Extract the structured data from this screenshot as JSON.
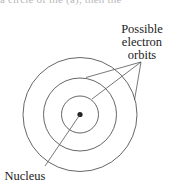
{
  "clipped_caption": "a circle of the (a), then the",
  "diagram": {
    "type": "bohr-atom-orbits",
    "labels": {
      "orbits_line1": "Possible",
      "orbits_line2": "electron",
      "orbits_line3": "orbits",
      "nucleus": "Nucleus"
    },
    "center": [
      80,
      114.5
    ],
    "orbit_radii": [
      18.5,
      36.5,
      57
    ],
    "nucleus_radius": 2.6,
    "colors": {
      "stroke": "#555555",
      "nucleus": "#222222",
      "text": "#222222"
    }
  }
}
